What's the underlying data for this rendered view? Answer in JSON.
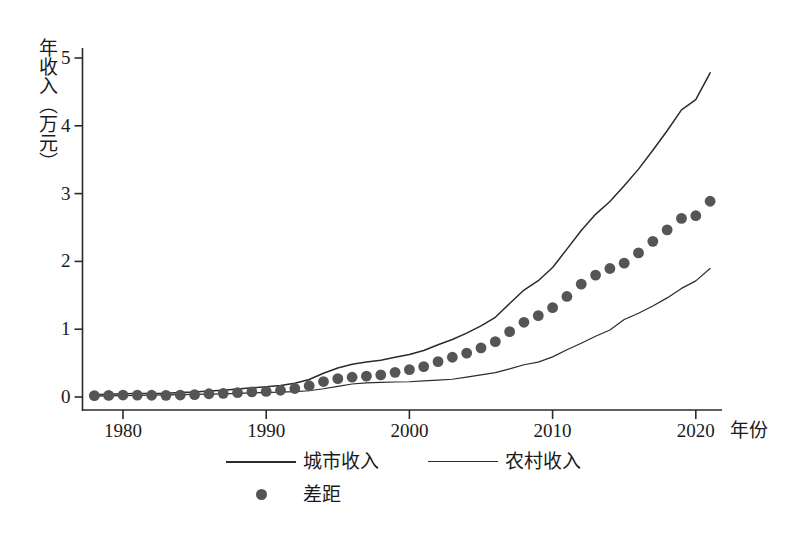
{
  "chart_data": {
    "type": "line",
    "title": "",
    "xlabel": "年份",
    "ylabel": "年收入（万元）",
    "xlim": [
      1977.3,
      1922.0
    ],
    "x_axis_range": [
      1977.3,
      2022.0
    ],
    "ylim": [
      0,
      5.25
    ],
    "grid": false,
    "legend_position": "bottom",
    "x_ticks": [
      "1980",
      "1990",
      "2000",
      "2010",
      "2020"
    ],
    "x_tick_values": [
      1980,
      1990,
      2000,
      2010,
      2020
    ],
    "y_ticks": [
      "0",
      "1",
      "2",
      "3",
      "4",
      "5"
    ],
    "y_tick_values": [
      0,
      1,
      2,
      3,
      4,
      5
    ],
    "x": [
      1978,
      1979,
      1980,
      1981,
      1982,
      1983,
      1984,
      1985,
      1986,
      1987,
      1988,
      1989,
      1990,
      1991,
      1992,
      1993,
      1994,
      1995,
      1996,
      1997,
      1998,
      1999,
      2000,
      2001,
      2002,
      2003,
      2004,
      2005,
      2006,
      2007,
      2008,
      2009,
      2010,
      2011,
      2012,
      2013,
      2014,
      2015,
      2016,
      2017,
      2018,
      2019,
      2020,
      2021
    ],
    "series": [
      {
        "name": "城市收入",
        "style": "line",
        "color": "#2b2b2b",
        "values": [
          0.034,
          0.039,
          0.048,
          0.05,
          0.053,
          0.056,
          0.065,
          0.074,
          0.09,
          0.1,
          0.118,
          0.136,
          0.151,
          0.17,
          0.203,
          0.258,
          0.35,
          0.428,
          0.484,
          0.516,
          0.543,
          0.585,
          0.628,
          0.686,
          0.77,
          0.848,
          0.942,
          1.049,
          1.176,
          1.378,
          1.578,
          1.715,
          1.91,
          2.181,
          2.456,
          2.694,
          2.884,
          3.116,
          3.361,
          3.639,
          3.927,
          4.236,
          4.387,
          4.782
        ]
      },
      {
        "name": "农村收入",
        "style": "line",
        "color": "#2b2b2b",
        "values": [
          0.014,
          0.016,
          0.019,
          0.022,
          0.027,
          0.031,
          0.036,
          0.04,
          0.042,
          0.046,
          0.054,
          0.06,
          0.069,
          0.071,
          0.078,
          0.092,
          0.122,
          0.158,
          0.192,
          0.209,
          0.216,
          0.221,
          0.225,
          0.237,
          0.248,
          0.262,
          0.294,
          0.325,
          0.359,
          0.414,
          0.476,
          0.515,
          0.592,
          0.698,
          0.792,
          0.896,
          0.989,
          1.142,
          1.236,
          1.343,
          1.462,
          1.602,
          1.713,
          1.895
        ]
      },
      {
        "name": "差距",
        "style": "dots",
        "color": "#555555",
        "values": [
          0.02,
          0.023,
          0.029,
          0.028,
          0.026,
          0.025,
          0.029,
          0.034,
          0.048,
          0.054,
          0.064,
          0.076,
          0.082,
          0.099,
          0.125,
          0.166,
          0.228,
          0.27,
          0.292,
          0.307,
          0.327,
          0.364,
          0.403,
          0.449,
          0.522,
          0.586,
          0.648,
          0.724,
          0.817,
          0.964,
          1.102,
          1.2,
          1.318,
          1.483,
          1.664,
          1.798,
          1.895,
          1.974,
          2.125,
          2.296,
          2.465,
          2.634,
          2.674,
          2.887
        ]
      }
    ]
  },
  "axis": {
    "y_label_text": "年收入（万元）",
    "x_label_text": "年份"
  },
  "legend": {
    "items": [
      {
        "label": "城市收入",
        "marker": "line"
      },
      {
        "label": "农村收入",
        "marker": "line"
      },
      {
        "label": "差距",
        "marker": "dot"
      }
    ]
  }
}
